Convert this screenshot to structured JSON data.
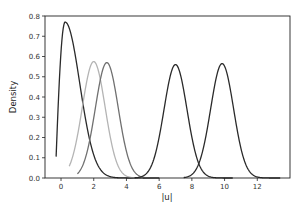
{
  "chart_data": {
    "type": "line",
    "title": "",
    "xlabel": "|u|",
    "ylabel": "Density",
    "xlim": [
      -0.98,
      14.0
    ],
    "ylim": [
      0.0,
      0.8
    ],
    "xticks": [
      0,
      2,
      4,
      6,
      8,
      10,
      12
    ],
    "yticks": [
      0.0,
      0.1,
      0.2,
      0.3,
      0.4,
      0.5,
      0.6,
      0.7,
      0.8
    ],
    "ytick_labels": [
      "0.0",
      "0.1",
      "0.2",
      "0.3",
      "0.4",
      "0.5",
      "0.6",
      "0.7",
      "0.8"
    ],
    "grid": false,
    "legend": null,
    "series": [
      {
        "name": "curve-1",
        "color": "#2a2a2a",
        "shape": "rayleigh-like",
        "peak_x": 0.25,
        "peak_y": 0.77,
        "x_range": [
          -0.3,
          6.0
        ]
      },
      {
        "name": "curve-2",
        "color": "#b4b4b4",
        "shape": "gaussian",
        "peak_x": 2.0,
        "peak_y": 0.575,
        "x_range": [
          0.5,
          5.0
        ]
      },
      {
        "name": "curve-3",
        "color": "#707070",
        "shape": "gaussian",
        "peak_x": 2.8,
        "peak_y": 0.57,
        "x_range": [
          1.0,
          6.0
        ]
      },
      {
        "name": "curve-4",
        "color": "#2a2a2a",
        "shape": "gaussian",
        "peak_x": 7.0,
        "peak_y": 0.56,
        "x_range": [
          4.5,
          10.5
        ]
      },
      {
        "name": "curve-5",
        "color": "#2a2a2a",
        "shape": "gaussian",
        "peak_x": 9.85,
        "peak_y": 0.565,
        "x_range": [
          7.5,
          13.4
        ]
      }
    ]
  },
  "labels": {
    "xlabel": "|u|",
    "ylabel": "Density"
  }
}
